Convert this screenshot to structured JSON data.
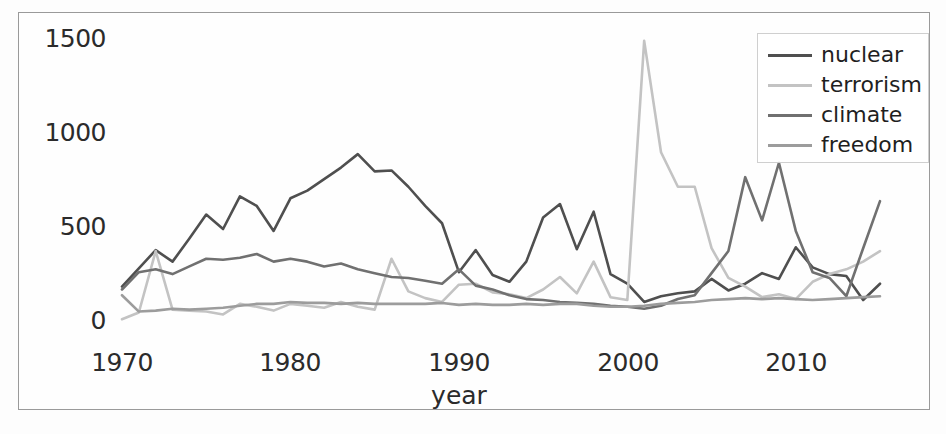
{
  "chart_data": {
    "type": "line",
    "title": "",
    "xlabel": "year",
    "ylabel": "",
    "xlim": [
      1970,
      2015
    ],
    "ylim": [
      0,
      1500
    ],
    "xticks": [
      1970,
      1980,
      1990,
      2000,
      2010
    ],
    "yticks": [
      0,
      500,
      1000,
      1500
    ],
    "grid": false,
    "legend_position": "upper right",
    "x": [
      1970,
      1971,
      1972,
      1973,
      1974,
      1975,
      1976,
      1977,
      1978,
      1979,
      1980,
      1981,
      1982,
      1983,
      1984,
      1985,
      1986,
      1987,
      1988,
      1989,
      1990,
      1991,
      1992,
      1993,
      1994,
      1995,
      1996,
      1997,
      1998,
      1999,
      2000,
      2001,
      2002,
      2003,
      2004,
      2005,
      2006,
      2007,
      2008,
      2009,
      2010,
      2011,
      2012,
      2013,
      2014,
      2015
    ],
    "series": [
      {
        "name": "nuclear",
        "color": "#4f4f4f",
        "values": [
          200,
          295,
          390,
          330,
          450,
          575,
          500,
          670,
          620,
          490,
          660,
          700,
          760,
          820,
          890,
          800,
          805,
          720,
          620,
          530,
          275,
          390,
          260,
          225,
          330,
          560,
          630,
          395,
          590,
          265,
          215,
          120,
          150,
          165,
          175,
          240,
          180,
          215,
          270,
          240,
          405,
          300,
          265,
          255,
          130,
          215
        ]
      },
      {
        "name": "terrorism",
        "color": "#c3c3c3",
        "values": [
          30,
          65,
          385,
          80,
          75,
          70,
          55,
          110,
          95,
          75,
          110,
          100,
          90,
          120,
          95,
          80,
          345,
          175,
          140,
          120,
          210,
          215,
          170,
          160,
          140,
          185,
          250,
          165,
          330,
          145,
          130,
          1480,
          900,
          720,
          720,
          400,
          245,
          200,
          145,
          160,
          135,
          225,
          265,
          290,
          330,
          385
        ]
      },
      {
        "name": "climate",
        "color": "#707070",
        "values": [
          185,
          275,
          290,
          265,
          305,
          345,
          340,
          350,
          370,
          330,
          345,
          330,
          305,
          320,
          290,
          270,
          250,
          245,
          230,
          215,
          290,
          205,
          185,
          155,
          135,
          130,
          120,
          115,
          110,
          100,
          95,
          85,
          100,
          135,
          155,
          270,
          385,
          770,
          545,
          845,
          490,
          275,
          245,
          150,
          400,
          645
        ]
      },
      {
        "name": "freedom",
        "color": "#9c9c9c",
        "values": [
          155,
          70,
          75,
          85,
          80,
          85,
          90,
          100,
          110,
          110,
          120,
          115,
          115,
          110,
          115,
          110,
          110,
          110,
          110,
          115,
          105,
          110,
          105,
          105,
          110,
          105,
          110,
          110,
          100,
          95,
          95,
          100,
          110,
          115,
          120,
          130,
          135,
          140,
          135,
          140,
          135,
          130,
          135,
          140,
          145,
          150
        ]
      }
    ]
  },
  "axes": {
    "ytick_labels": [
      "1500",
      "1000",
      "500",
      "0"
    ],
    "xtick_labels": [
      "1970",
      "1980",
      "1990",
      "2000",
      "2010"
    ],
    "xaxis_title": "year"
  },
  "legend": {
    "items": [
      {
        "label": "nuclear"
      },
      {
        "label": "terrorism"
      },
      {
        "label": "climate"
      },
      {
        "label": "freedom"
      }
    ]
  }
}
